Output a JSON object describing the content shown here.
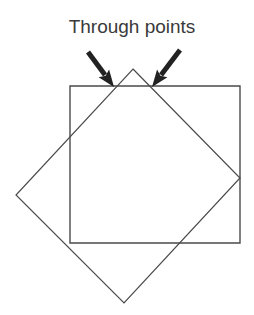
{
  "figure": {
    "background_color": "#ffffff",
    "stroke_color": "#4a4a4a",
    "arrow_color": "#222222",
    "text_color": "#3a3a3a",
    "caption": "Through points",
    "width": 254,
    "height": 315,
    "shapes": {
      "axis_aligned_square": {
        "name": "upright-square",
        "points": "70,86 240,86 240,243 70,243",
        "stroke_width": 1.4
      },
      "rotated_square": {
        "name": "rotated-square-diamond",
        "points": "133,69 240,178 124,303 16,195",
        "stroke_width": 1.2
      }
    },
    "arrows": [
      {
        "name": "left-arrow",
        "tail_x": 88,
        "tail_y": 52,
        "tip_x": 114,
        "tip_y": 87,
        "stroke_width": 5
      },
      {
        "name": "right-arrow",
        "tail_x": 180,
        "tail_y": 50,
        "tip_x": 152,
        "tip_y": 87,
        "stroke_width": 5
      }
    ],
    "intersection_points": [
      {
        "name": "left-through-point",
        "x": 114,
        "y": 87
      },
      {
        "name": "right-through-point",
        "x": 152,
        "y": 87
      }
    ]
  }
}
